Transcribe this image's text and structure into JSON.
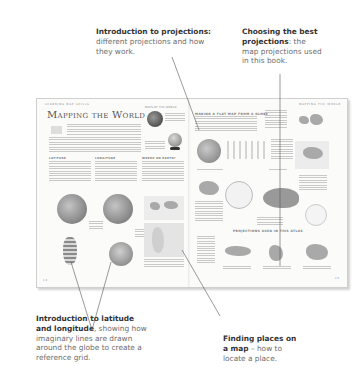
{
  "callouts": [
    {
      "id": "projections-intro",
      "bold": "Introduction to projections:",
      "rest": "different projections and how they work."
    },
    {
      "id": "choosing-projections",
      "bold": "Choosing the best projections",
      "rest": ": the map projections used in this book."
    },
    {
      "id": "latitude-longitude",
      "bold": "Introduction to latitude and longitude",
      "rest": ", showing how imaginary lines are drawn around the globe to create a reference grid."
    },
    {
      "id": "finding-places",
      "bold": "Finding places on a map",
      "rest": " – how to locate a place."
    }
  ],
  "spread": {
    "left_page": {
      "running_head": "Learning map skills",
      "title": "Mapping the World",
      "sidebar_head": "Maps of the World",
      "sections": [
        "Latitude",
        "Longitude",
        "Where on Earth?"
      ],
      "page_number": "14"
    },
    "right_page": {
      "running_head": "Mapping the World",
      "section_head": "Making a flat map from a globe",
      "projections_head": "Projections used in this atlas",
      "page_number": "15"
    }
  },
  "colors": {
    "callout_bold": "#333333",
    "callout_text": "#6d6d6d",
    "leader_line": "#555555",
    "page_bg": "#fbfbfa"
  }
}
